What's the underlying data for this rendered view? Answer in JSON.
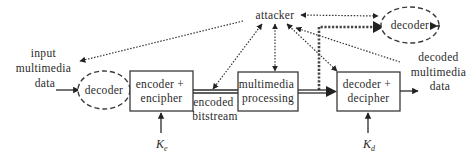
{
  "diagram": {
    "title": "",
    "nodes": {
      "attacker": {
        "label": "attacker"
      },
      "input_data": {
        "lines": [
          "input",
          "multimedia",
          "data"
        ]
      },
      "input_decoder": {
        "label": "decoder",
        "shape": "dashed-ellipse"
      },
      "encoder": {
        "lines": [
          "encoder +",
          "encipher"
        ]
      },
      "bitstream": {
        "lines": [
          "encoded",
          "bitstream"
        ]
      },
      "processing": {
        "lines": [
          "multimedia",
          "processing"
        ]
      },
      "decoder_box": {
        "lines": [
          "decoder +",
          "decipher"
        ]
      },
      "output_data": {
        "lines": [
          "decoded",
          "multimedia",
          "data"
        ]
      },
      "attacker_decoder": {
        "label": "decoder",
        "shape": "dashed-ellipse"
      },
      "key_e": {
        "base": "K",
        "sub": "e"
      },
      "key_d": {
        "base": "K",
        "sub": "d"
      }
    },
    "edges": [
      {
        "from": "input_data",
        "to": "input_decoder",
        "style": "solid"
      },
      {
        "from": "input_decoder",
        "to": "encoder",
        "style": "solid"
      },
      {
        "from": "encoder",
        "to": "processing",
        "style": "double",
        "label": "encoded bitstream"
      },
      {
        "from": "processing",
        "to": "decoder_box",
        "style": "double-arrow"
      },
      {
        "from": "decoder_box",
        "to": "output_data",
        "style": "solid"
      },
      {
        "from": "key_e",
        "to": "encoder",
        "style": "solid"
      },
      {
        "from": "key_d",
        "to": "decoder_box",
        "style": "solid"
      },
      {
        "from": "attacker",
        "to": "input_data",
        "style": "dotted"
      },
      {
        "from": "attacker",
        "to": "bitstream",
        "style": "dotted-bidirectional"
      },
      {
        "from": "attacker",
        "to": "processing",
        "style": "dotted-bidirectional"
      },
      {
        "from": "attacker",
        "to": "decoder_box",
        "style": "dotted-bidirectional"
      },
      {
        "from": "attacker",
        "to": "attacker_decoder",
        "style": "dotted-bidirectional"
      },
      {
        "from": "output_data",
        "to": "attacker",
        "style": "dotted"
      },
      {
        "from": "processing_output",
        "to": "attacker_decoder",
        "style": "thick-dashed"
      },
      {
        "from": "attacker_decoder",
        "to": "outside",
        "style": "dashed"
      }
    ]
  }
}
